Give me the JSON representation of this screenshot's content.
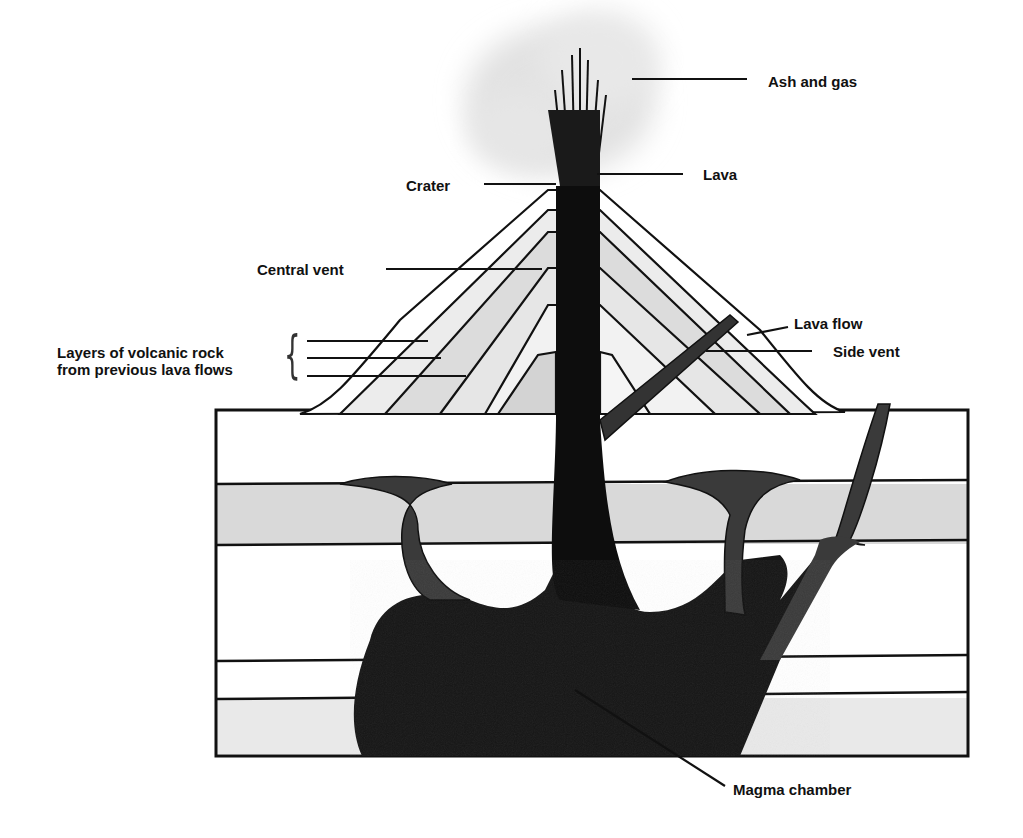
{
  "diagram": {
    "colors": {
      "background": "#ffffff",
      "outline": "#111111",
      "rock_layer_gray": "#d9d9d9",
      "rock_layer_light": "#ebebeb",
      "magma": "#1a1a1a",
      "magma_branch": "#333333",
      "ash_cloud": "#e4e4e4"
    },
    "labels": {
      "ash_and_gas": "Ash and gas",
      "lava": "Lava",
      "crater": "Crater",
      "central_vent": "Central vent",
      "layers_line1": "Layers of volcanic rock",
      "layers_line2": "from previous lava flows",
      "lava_flow": "Lava flow",
      "side_vent": "Side vent",
      "magma_chamber": "Magma chamber"
    },
    "brace_glyph": "{"
  }
}
